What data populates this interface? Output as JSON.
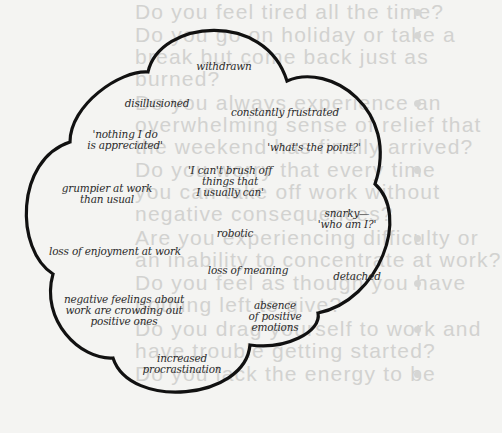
{
  "diagram": {
    "type": "thought-cloud",
    "colors": {
      "outline": "#111111",
      "label": "#2b2b2b",
      "background": "#f4f4f2",
      "showthrough": "#d2d2d0"
    },
    "labels": [
      {
        "id": "withdrawn",
        "lines": [
          "withdrawn"
        ],
        "x": 224,
        "y": 61
      },
      {
        "id": "disillusioned",
        "lines": [
          "disillusioned"
        ],
        "x": 157,
        "y": 98
      },
      {
        "id": "constantly-frustrated",
        "lines": [
          "constantly frustrated"
        ],
        "x": 285,
        "y": 107
      },
      {
        "id": "nothing-i-do",
        "lines": [
          "'nothing I do",
          "is appreciated'"
        ],
        "x": 125,
        "y": 129
      },
      {
        "id": "whats-the-point",
        "lines": [
          "'what's the point?'"
        ],
        "x": 314,
        "y": 142
      },
      {
        "id": "cant-brush-off",
        "lines": [
          "'I can't brush off",
          "things that",
          "I usually can'"
        ],
        "x": 230,
        "y": 165
      },
      {
        "id": "grumpier",
        "lines": [
          "grumpier at work",
          "than usual"
        ],
        "x": 107,
        "y": 183
      },
      {
        "id": "snarky",
        "lines": [
          "snarky—",
          "'who am I?'"
        ],
        "x": 347,
        "y": 208
      },
      {
        "id": "robotic",
        "lines": [
          "robotic"
        ],
        "x": 235,
        "y": 228
      },
      {
        "id": "loss-of-enjoyment",
        "lines": [
          "loss of enjoyment at work"
        ],
        "x": 115,
        "y": 246
      },
      {
        "id": "loss-of-meaning",
        "lines": [
          "loss of meaning"
        ],
        "x": 248,
        "y": 265
      },
      {
        "id": "detached",
        "lines": [
          "detached"
        ],
        "x": 357,
        "y": 271
      },
      {
        "id": "negative-feelings",
        "lines": [
          "negative feelings about",
          "work are crowding out",
          "positive ones"
        ],
        "x": 124,
        "y": 294
      },
      {
        "id": "absence",
        "lines": [
          "absence",
          "of positive",
          "emotions"
        ],
        "x": 275,
        "y": 300
      },
      {
        "id": "increased-procrastination",
        "lines": [
          "increased",
          "procrastination"
        ],
        "x": 182,
        "y": 353
      }
    ]
  },
  "showthrough_text": {
    "lines": [
      {
        "text": "Do you feel tired all the time?",
        "y": 1,
        "bullet": true
      },
      {
        "text": "Do you go on holiday or take a",
        "y": 24,
        "bullet": true
      },
      {
        "text": "break but come back just as",
        "y": 46,
        "bullet": false
      },
      {
        "text": "burned?",
        "y": 68,
        "bullet": false
      },
      {
        "text": "Do you always experience an",
        "y": 92,
        "bullet": true
      },
      {
        "text": "overwhelming sense of relief that",
        "y": 114,
        "bullet": false
      },
      {
        "text": "the weekend has finally arrived?",
        "y": 136,
        "bullet": false
      },
      {
        "text": "Do you worry that every time",
        "y": 159,
        "bullet": true
      },
      {
        "text": "you can take off work without",
        "y": 181,
        "bullet": false
      },
      {
        "text": "negative consequences?",
        "y": 203,
        "bullet": false
      },
      {
        "text": "Are you experiencing difficulty or",
        "y": 227,
        "bullet": true
      },
      {
        "text": "an inability to concentrate at work?",
        "y": 249,
        "bullet": false
      },
      {
        "text": "Do you feel as though you have",
        "y": 272,
        "bullet": true
      },
      {
        "text": "nothing left to give?",
        "y": 294,
        "bullet": false
      },
      {
        "text": "Do you drag yourself to work and",
        "y": 318,
        "bullet": true
      },
      {
        "text": "have trouble getting started?",
        "y": 340,
        "bullet": false
      },
      {
        "text": "Do you lack the energy to be",
        "y": 363,
        "bullet": true
      }
    ]
  }
}
